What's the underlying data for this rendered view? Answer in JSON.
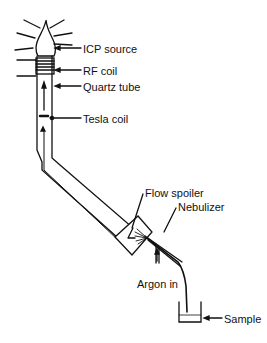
{
  "diagram": {
    "type": "ICP torch schematic",
    "labels": {
      "icp_source": "ICP source",
      "rf_coil": "RF coil",
      "quartz_tube": "Quartz tube",
      "tesla_coil": "Tesla coil",
      "flow_spoiler": "Flow spoiler",
      "nebulizer": "Nebulizer",
      "argon_in": "Argon in",
      "sample": "Sample"
    }
  }
}
